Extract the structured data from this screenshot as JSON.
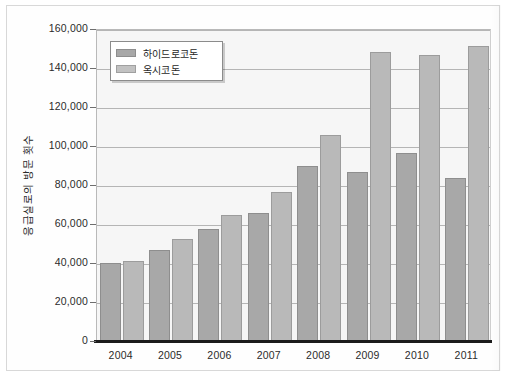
{
  "chart_data": {
    "type": "bar",
    "title": "",
    "xlabel": "",
    "ylabel": "응급실로의 방문 횟수",
    "categories": [
      "2004",
      "2005",
      "2006",
      "2007",
      "2008",
      "2009",
      "2010",
      "2011"
    ],
    "series": [
      {
        "name": "하이드로코돈",
        "color": "#a8a8a8",
        "values": [
          40000,
          46500,
          57500,
          65500,
          89500,
          86500,
          96500,
          83500
        ]
      },
      {
        "name": "옥시코돈",
        "color": "#b9b9b9",
        "values": [
          41000,
          52500,
          64500,
          76500,
          105500,
          148000,
          146500,
          151500
        ]
      }
    ],
    "ylim": [
      0,
      160000
    ],
    "ytick_values": [
      0,
      20000,
      40000,
      60000,
      80000,
      100000,
      120000,
      140000,
      160000
    ],
    "ytick_labels": [
      "0",
      "20,000",
      "40,000",
      "60,000",
      "80,000",
      "100,000",
      "120,000",
      "140,000",
      "160,000"
    ],
    "grid": true,
    "legend_position": "top-left"
  }
}
